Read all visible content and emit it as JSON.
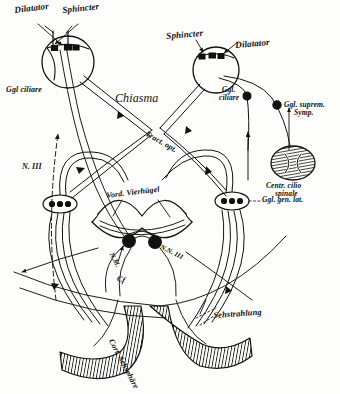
{
  "figure": {
    "kind": "anatomical-diagram",
    "language": "German / Latin anatomical nomenclature",
    "background_color": "#fdfdfb",
    "ink_color": "#111111"
  },
  "labels": {
    "dilatator_left": "Dilatator",
    "sphincter_left": "Sphincter",
    "ggl_ciliare_left": "Ggl ciliare",
    "sphincter_right": "Sphincter",
    "dilatator_right": "Dilatator",
    "ggl_ciliare_right_line1": "Ggl.",
    "ggl_ciliare_right_line2": "ciliare",
    "chiasma": "Chiasma",
    "tractus_opticus": "Tract. opt.",
    "ggl_suprem_symp_line1": "Ggl. suprem.",
    "ggl_suprem_symp_line2": "Symp.",
    "centrum_ciliospinale_line1": "Centr. cilio",
    "centrum_ciliospinale_line2": "spinale",
    "nervus_iii": "N. III",
    "ggl_gen_lat": "Ggl. gen. lat.",
    "vord_vierhuegel": "Vord. Vierhügel",
    "nucleus_nn_iii": "N.N. III",
    "nucleus_em": "N.M.",
    "cf": "Cf",
    "sehstrahlung": "Sehstrahlung",
    "cort_sehsphaere": "Cort. Sehsphäre"
  },
  "structures": {
    "eyes": [
      {
        "name": "left-eye",
        "cx": 68,
        "cy": 62,
        "r": 26
      },
      {
        "name": "right-eye",
        "cx": 216,
        "cy": 70,
        "r": 23
      }
    ],
    "geniculate_bodies": [
      {
        "name": "left-lateral-geniculate",
        "cx": 60,
        "cy": 204
      },
      {
        "name": "right-lateral-geniculate",
        "cx": 232,
        "cy": 201
      }
    ],
    "oculomotor_nuclei": [
      {
        "name": "edinger-westphal-nucleus-left",
        "cx": 129,
        "cy": 241,
        "r": 6
      },
      {
        "name": "oculomotor-nucleus-right",
        "cx": 155,
        "cy": 242,
        "r": 6
      }
    ],
    "ciliospinal_center": {
      "cx": 293,
      "cy": 163,
      "rx": 22,
      "ry": 17
    },
    "sympathetic_ganglion": {
      "cx": 277,
      "cy": 105,
      "r": 4
    },
    "ciliary_ganglion_right": {
      "cx": 247,
      "cy": 96,
      "r": 4
    },
    "occipital_cortex": {
      "name": "cortical-visual-area",
      "label": "Cort. Sehsphäre"
    }
  }
}
